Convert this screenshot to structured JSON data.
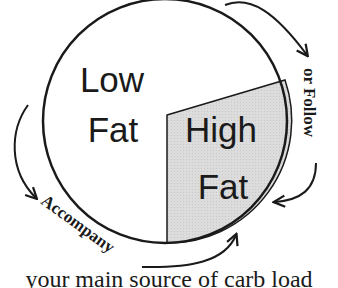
{
  "diagram": {
    "pie": {
      "slices": [
        {
          "label_line1": "Low",
          "label_line2": "Fat",
          "fill": "#ffffff"
        },
        {
          "label_line1": "High",
          "label_line2": "Fat",
          "fill": "#d9d9d9"
        }
      ],
      "stroke": "#1a1a1a"
    },
    "arrows": {
      "follow_label": "or Follow",
      "accompany_label": "Accompany"
    },
    "caption": "your main source of carb load"
  }
}
